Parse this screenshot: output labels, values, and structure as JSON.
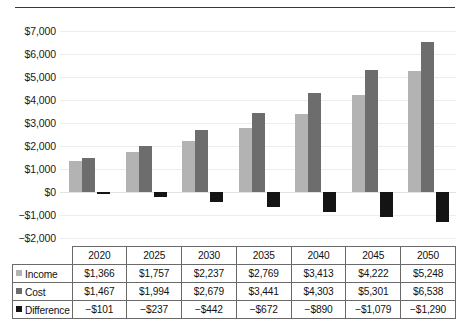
{
  "chart_data": {
    "type": "bar",
    "title": "",
    "subtitle": "",
    "xlabel": "",
    "ylabel": "",
    "categories": [
      "2020",
      "2025",
      "2030",
      "2035",
      "2040",
      "2045",
      "2050"
    ],
    "series": [
      {
        "name": "Income",
        "color": "#b3b3b3",
        "values": [
          1366,
          1757,
          2237,
          2769,
          3413,
          4222,
          5248
        ],
        "labels": [
          "$1,366",
          "$1,757",
          "$2,237",
          "$2,769",
          "$3,413",
          "$4,222",
          "$5,248"
        ]
      },
      {
        "name": "Cost",
        "color": "#6d6d6d",
        "values": [
          1467,
          1994,
          2679,
          3441,
          4303,
          5301,
          6538
        ],
        "labels": [
          "$1,467",
          "$1,994",
          "$2,679",
          "$3,441",
          "$4,303",
          "$5,301",
          "$6,538"
        ]
      },
      {
        "name": "Difference",
        "color": "#141414",
        "values": [
          -101,
          -237,
          -442,
          -672,
          -890,
          -1079,
          -1290
        ],
        "labels": [
          "−$101",
          "−$237",
          "−$442",
          "−$672",
          "−$890",
          "−$1,079",
          "−$1,290"
        ]
      }
    ],
    "ylim": [
      -2000,
      7000
    ],
    "ytick_values": [
      7000,
      6000,
      5000,
      4000,
      3000,
      2000,
      1000,
      0,
      -1000,
      -2000
    ],
    "ytick_labels": [
      "$7,000",
      "$6,000",
      "$5,000",
      "$4,000",
      "$3,000",
      "$2,000",
      "$1,000",
      "$0",
      "−$1,000",
      "−$2,000"
    ],
    "grid": true,
    "legend_position": "table-left-column",
    "data_table_visible": true
  },
  "table": {
    "header": [
      "",
      "2020",
      "2025",
      "2030",
      "2035",
      "2040",
      "2045",
      "2050"
    ],
    "rows": [
      {
        "legend": "Income",
        "swatch_color": "#b3b3b3",
        "cells": [
          "$1,366",
          "$1,757",
          "$2,237",
          "$2,769",
          "$3,413",
          "$4,222",
          "$5,248"
        ]
      },
      {
        "legend": "Cost",
        "swatch_color": "#6d6d6d",
        "cells": [
          "$1,467",
          "$1,994",
          "$2,679",
          "$3,441",
          "$4,303",
          "$5,301",
          "$6,538"
        ]
      },
      {
        "legend": "Difference",
        "swatch_color": "#141414",
        "cells": [
          "−$101",
          "−$237",
          "−$442",
          "−$672",
          "−$890",
          "−$1,079",
          "−$1,290"
        ]
      }
    ]
  }
}
